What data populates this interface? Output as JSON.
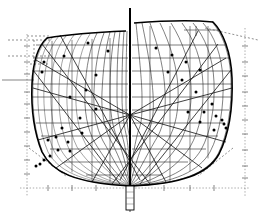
{
  "drawing": {
    "type": "ship-hull-body-plan",
    "title": "Body Plan",
    "description": "Naval architecture lines drawing: transverse hull sections (body plan) with waterlines, buttocks, diagonals and measured offset points",
    "background_color": "#ffffff",
    "line_color": "#000000",
    "construction_color": "#555555",
    "canvas": {
      "width": 265,
      "height": 217
    }
  },
  "geometry": {
    "centerline_x": 130,
    "baseline_y": 188,
    "keel_bottom_y": 186,
    "deck_left_y": 38,
    "deck_right_y": 22,
    "centerline_top_y": 8,
    "centerline_bottom_y": 196,
    "max_beam_left_x": 33,
    "max_beam_right_x": 232,
    "diagonal_focus": {
      "x": 130,
      "y": 115
    }
  },
  "hull": {
    "after_body_outline": "M 47,38 C 38,46 33,62 32,84 C 31,108 34,132 42,152 C 52,172 74,183 130,186",
    "fore_body_outline": "M 213,22 C 223,32 231,52 232,78 C 233,106 229,134 219,154 C 208,174 182,184 130,186",
    "sheer_left": "M 47,38 C 70,34 100,32 126,31",
    "sheer_right": "M 134,23 C 160,21 192,20 213,22"
  },
  "stations": {
    "after_body_label": "Stations 0-5 (after body, port side)",
    "fore_body_label": "Stations 5-10 (fore body, starboard side)",
    "after_body_count": 14,
    "fore_body_count": 9,
    "after_body_curves": [
      "M 48,38 C 39,47 34,63 33,85 C 32,110 35,133 43,153 C 53,172 76,183 130,186",
      "M 53,37 C 44,46 39,63 38,85 C 37,110 40,133 48,152 C 58,170 79,182 130,186",
      "M 59,36 C 50,46 45,63 44,86 C 43,110 46,133 54,151 C 64,169 84,181 130,186",
      "M 66,36 C 57,46 52,64 51,86 C 50,110 53,133 61,150 C 71,167 89,180 130,186",
      "M 74,35 C 65,46 60,64 59,87 C 58,110 61,132 69,149 C 79,165 95,179 130,186",
      "M 82,34 C 73,46 68,65 67,88 C 66,110 69,131 77,147 C 87,162 101,177 130,186",
      "M 90,34 C 82,46 77,66 76,89 C 75,110 78,130 86,145 C 95,159 108,175 130,186",
      "M 97,33 C 90,47 86,67 85,90 C 84,110 87,129 95,143 C 103,156 114,173 130,186",
      "M 104,33 C 98,48 95,69 94,91 C 93,110 96,128 103,141 C 110,153 119,171 130,186",
      "M 110,32 C 105,50 103,71 102,92 C 101,110 104,127 110,139 C 116,150 124,169 130,186",
      "M 115,32 C 111,52 110,73 110,93 C 110,110 112,126 117,137 C 121,147 127,167 130,186",
      "M 120,31 C 117,55 117,76 117,95 C 117,111 119,125 122,135 C 125,145 129,165 130,186",
      "M 124,31 C 122,58 122,79 122,97 C 122,112 124,125 126,134 C 128,143 130,163 130,186",
      "M 127,31 C 126,62 126,83 126,100 C 126,114 127,126 129,134 C 130,142 130,162 130,186"
    ],
    "fore_body_curves": [
      "M 212,22 C 222,33 230,53 231,79 C 232,106 228,134 218,154 C 207,173 181,184 130,186",
      "M 203,23 C 214,35 222,55 223,80 C 224,106 220,133 210,152 C 199,171 175,183 130,186",
      "M 193,23 C 205,37 213,57 214,82 C 215,106 211,132 201,150 C 190,168 168,182 130,186",
      "M 182,23 C 194,39 202,60 203,84 C 204,107 200,130 190,147 C 179,164 160,180 130,186",
      "M 171,23 C 183,42 190,63 191,86 C 192,108 188,128 179,144 C 169,159 152,178 130,186",
      "M 160,23 C 171,46 177,67 178,88 C 179,109 176,126 168,140 C 159,153 144,175 130,186",
      "M 150,23 C 160,51 164,72 165,91 C 166,110 164,124 158,136 C 151,147 139,171 130,186",
      "M 142,23 C 149,57 152,77 153,94 C 154,111 153,123 148,132 C 143,141 134,167 130,186",
      "M 136,23 C 140,64 142,83 142,98 C 142,113 142,122 139,129 C 136,137 131,163 130,186"
    ]
  },
  "waterlines": {
    "label": "Waterlines",
    "count": 9,
    "y_values": [
      45,
      58,
      71,
      84,
      97,
      110,
      123,
      136,
      149,
      162,
      175
    ],
    "left_extents": [
      [
        36,
        128
      ],
      [
        33,
        128
      ],
      [
        32,
        128
      ],
      [
        32,
        128
      ],
      [
        32,
        128
      ],
      [
        33,
        128
      ],
      [
        36,
        128
      ],
      [
        41,
        128
      ],
      [
        50,
        128
      ],
      [
        64,
        128
      ],
      [
        86,
        128
      ]
    ],
    "right_extents": [
      [
        132,
        226
      ],
      [
        132,
        230
      ],
      [
        132,
        232
      ],
      [
        132,
        232
      ],
      [
        132,
        231
      ],
      [
        132,
        229
      ],
      [
        132,
        225
      ],
      [
        132,
        218
      ],
      [
        132,
        206
      ],
      [
        132,
        188
      ],
      [
        132,
        162
      ]
    ]
  },
  "buttocks": {
    "label": "Buttock lines",
    "left_x": [
      52,
      72,
      92,
      110
    ],
    "right_x": [
      150,
      170,
      190,
      208
    ]
  },
  "diagonals": {
    "label": "Diagonals with measured offset points",
    "focus_x": 130,
    "focus_y": 115,
    "lines": [
      {
        "x1": 130,
        "y1": 115,
        "x2": 36,
        "y2": 60
      },
      {
        "x1": 130,
        "y1": 115,
        "x2": 33,
        "y2": 88
      },
      {
        "x1": 130,
        "y1": 115,
        "x2": 38,
        "y2": 140
      },
      {
        "x1": 130,
        "y1": 115,
        "x2": 56,
        "y2": 168
      },
      {
        "x1": 130,
        "y1": 115,
        "x2": 92,
        "y2": 182
      },
      {
        "x1": 130,
        "y1": 115,
        "x2": 226,
        "y2": 58
      },
      {
        "x1": 130,
        "y1": 115,
        "x2": 232,
        "y2": 88
      },
      {
        "x1": 130,
        "y1": 115,
        "x2": 226,
        "y2": 142
      },
      {
        "x1": 130,
        "y1": 115,
        "x2": 202,
        "y2": 168
      },
      {
        "x1": 130,
        "y1": 115,
        "x2": 166,
        "y2": 182
      }
    ],
    "long_diagonals": [
      {
        "x1": 42,
        "y1": 44,
        "x2": 150,
        "y2": 184
      },
      {
        "x1": 33,
        "y1": 70,
        "x2": 120,
        "y2": 184
      },
      {
        "x1": 218,
        "y1": 44,
        "x2": 112,
        "y2": 184
      },
      {
        "x1": 231,
        "y1": 70,
        "x2": 140,
        "y2": 184
      },
      {
        "x1": 60,
        "y1": 35,
        "x2": 140,
        "y2": 180
      },
      {
        "x1": 198,
        "y1": 31,
        "x2": 120,
        "y2": 180
      }
    ]
  },
  "offset_points": {
    "label": "Measured offset points",
    "count": 34,
    "after_body": [
      [
        108,
        51
      ],
      [
        88,
        43
      ],
      [
        64,
        56
      ],
      [
        44,
        62
      ],
      [
        42,
        72
      ],
      [
        96,
        75
      ],
      [
        86,
        90
      ],
      [
        70,
        97
      ],
      [
        96,
        109
      ],
      [
        80,
        118
      ],
      [
        62,
        128
      ],
      [
        48,
        140
      ],
      [
        82,
        133
      ],
      [
        68,
        142
      ],
      [
        58,
        150
      ],
      [
        50,
        156
      ],
      [
        44,
        160
      ],
      [
        40,
        164
      ],
      [
        36,
        166
      ],
      [
        70,
        151
      ],
      [
        56,
        137
      ]
    ],
    "fore_body": [
      [
        156,
        48
      ],
      [
        172,
        55
      ],
      [
        186,
        62
      ],
      [
        200,
        70
      ],
      [
        168,
        72
      ],
      [
        182,
        80
      ],
      [
        196,
        92
      ],
      [
        212,
        104
      ],
      [
        204,
        112
      ],
      [
        216,
        116
      ],
      [
        222,
        120
      ],
      [
        224,
        124
      ],
      [
        226,
        128
      ],
      [
        214,
        130
      ],
      [
        200,
        122
      ],
      [
        188,
        112
      ]
    ]
  },
  "construction_lines": {
    "label": "Construction / reference lines",
    "vertical_left_x": 27,
    "vertical_right_x": 245,
    "horizontal_baseline_y": 188,
    "top_left_box": {
      "x": 27,
      "y": 36,
      "w": 22,
      "h": 28
    },
    "upper_left_dash_y": 40,
    "mid_left_dash_y": 56,
    "left_solid_tick_y": 80,
    "right_solid_tick_y": 44,
    "lower_left_diagonal": {
      "x1": 30,
      "y1": 150,
      "x2": 62,
      "y2": 174
    },
    "lower_right_diagonal": {
      "x1": 232,
      "y1": 150,
      "x2": 200,
      "y2": 174
    },
    "tick_count_left": 18,
    "tick_count_right": 18
  },
  "keel": {
    "label": "Keel / deadwood",
    "x": 126,
    "y": 186,
    "width": 8,
    "height": 24,
    "centerline_extension_y": 210
  }
}
